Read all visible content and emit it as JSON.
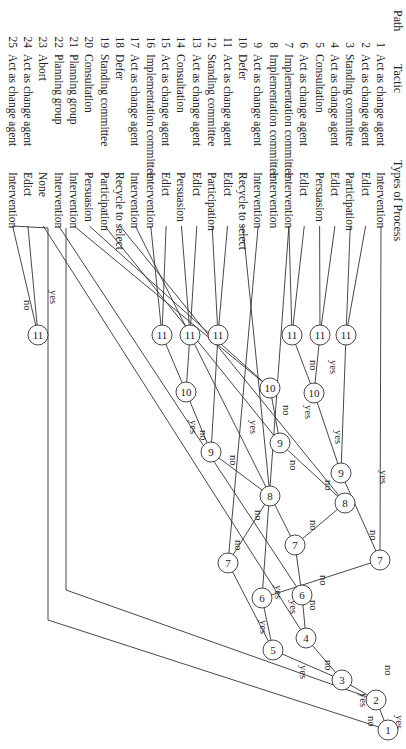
{
  "headers": {
    "path": "Path",
    "tactic": "Tactic",
    "process": "Types of Process"
  },
  "rows": [
    {
      "path": "1",
      "tactic": "Act as change agent",
      "process": "Intervention"
    },
    {
      "path": "2",
      "tactic": "Act as change agent",
      "process": "Edict"
    },
    {
      "path": "3",
      "tactic": "Standing committee",
      "process": "Participation"
    },
    {
      "path": "4",
      "tactic": "Act as change agent",
      "process": "Edict"
    },
    {
      "path": "5",
      "tactic": "Consultation",
      "process": "Persuasion"
    },
    {
      "path": "6",
      "tactic": "Act as change agent",
      "process": "Edict"
    },
    {
      "path": "7",
      "tactic": "Implementation committee",
      "process": "Intervention"
    },
    {
      "path": "8",
      "tactic": "Implementation committee",
      "process": "Intervention"
    },
    {
      "path": "9",
      "tactic": "Act as change agent",
      "process": "Intervention"
    },
    {
      "path": "10",
      "tactic": "Defer",
      "process": "Recycle to select"
    },
    {
      "path": "11",
      "tactic": "Act as change agent",
      "process": "Edict"
    },
    {
      "path": "12",
      "tactic": "Standing committee",
      "process": "Participation"
    },
    {
      "path": "13",
      "tactic": "Act as change agent",
      "process": "Edict"
    },
    {
      "path": "14",
      "tactic": "Consultation",
      "process": "Persuasion"
    },
    {
      "path": "15",
      "tactic": "Act as change agent",
      "process": "Edict"
    },
    {
      "path": "16",
      "tactic": "Implementation committee",
      "process": "Intervention"
    },
    {
      "path": "17",
      "tactic": "Act as change agent",
      "process": "Intervention"
    },
    {
      "path": "18",
      "tactic": "Defer",
      "process": "Recycle to select"
    },
    {
      "path": "19",
      "tactic": "Standing committee",
      "process": "Participation"
    },
    {
      "path": "20",
      "tactic": "Consultation",
      "process": "Persuasion"
    },
    {
      "path": "21",
      "tactic": "Planning group",
      "process": "Intervention"
    },
    {
      "path": "22",
      "tactic": "Planning group",
      "process": "Intervention"
    },
    {
      "path": "23",
      "tactic": "Abort",
      "process": "None"
    },
    {
      "path": "24",
      "tactic": "Act as change agent",
      "process": "Edict"
    },
    {
      "path": "25",
      "tactic": "Act as change agent",
      "process": "Intervention"
    }
  ],
  "nodes": [
    {
      "id": "n1",
      "label": "1"
    },
    {
      "id": "n2",
      "label": "2"
    },
    {
      "id": "n3",
      "label": "3"
    },
    {
      "id": "n4",
      "label": "4"
    },
    {
      "id": "n5",
      "label": "5"
    },
    {
      "id": "n6a",
      "label": "6"
    },
    {
      "id": "n6b",
      "label": "6"
    },
    {
      "id": "n7a",
      "label": "7"
    },
    {
      "id": "n7b",
      "label": "7"
    },
    {
      "id": "n7c",
      "label": "7"
    },
    {
      "id": "n8a",
      "label": "8"
    },
    {
      "id": "n8b",
      "label": "8"
    },
    {
      "id": "n9a",
      "label": "9"
    },
    {
      "id": "n9b",
      "label": "9"
    },
    {
      "id": "n9c",
      "label": "9"
    },
    {
      "id": "n10a",
      "label": "10"
    },
    {
      "id": "n10b",
      "label": "10"
    },
    {
      "id": "n10c",
      "label": "10"
    },
    {
      "id": "n11a",
      "label": "11"
    },
    {
      "id": "n11b",
      "label": "11"
    },
    {
      "id": "n11c",
      "label": "11"
    },
    {
      "id": "n11d",
      "label": "11"
    },
    {
      "id": "n11e",
      "label": "11"
    },
    {
      "id": "n11f",
      "label": "11"
    },
    {
      "id": "n11g",
      "label": "11"
    }
  ],
  "edge_labels": {
    "yes": "yes",
    "no": "no"
  }
}
